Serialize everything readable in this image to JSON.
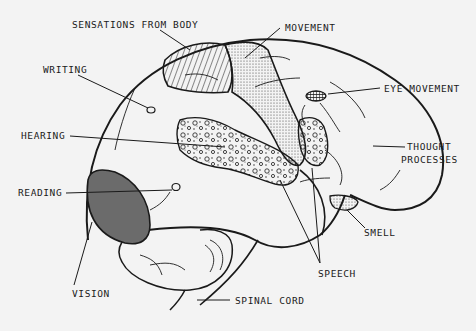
{
  "diagram": {
    "type": "labeled-anatomy-illustration",
    "colors": {
      "background": "#f3f3f3",
      "ink": "#1a1a1a",
      "vision_fill": "#6b6b6b"
    },
    "labels": {
      "sensations": "SENSATIONS FROM BODY",
      "movement": "MOVEMENT",
      "writing": "WRITING",
      "eye_movement": "EYE MOVEMENT",
      "hearing": "HEARING",
      "thought_1": "THOUGHT",
      "thought_2": "PROCESSES",
      "reading": "READING",
      "smell": "SMELL",
      "vision": "VISION",
      "speech": "SPEECH",
      "spinal_cord": "SPINAL CORD"
    },
    "regions": [
      {
        "name": "Sensations from body",
        "pattern": "diagonal-hatch"
      },
      {
        "name": "Movement",
        "pattern": "fine-stipple"
      },
      {
        "name": "Eye movement",
        "pattern": "cross-hatch"
      },
      {
        "name": "Hearing",
        "pattern": "circles-stipple"
      },
      {
        "name": "Speech",
        "pattern": "circles-stipple"
      },
      {
        "name": "Smell",
        "pattern": "fine-stipple"
      },
      {
        "name": "Vision",
        "pattern": "solid-gray"
      },
      {
        "name": "Writing",
        "pattern": "small-oval"
      },
      {
        "name": "Reading",
        "pattern": "small-oval"
      },
      {
        "name": "Thought processes",
        "pattern": "none"
      }
    ]
  }
}
